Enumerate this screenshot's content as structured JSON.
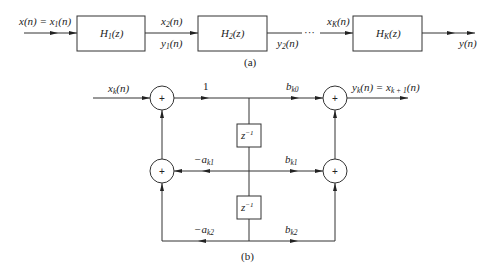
{
  "part_a": {
    "caption": "(a)",
    "input_label": "x(n) = x",
    "input_label_sub": "1",
    "input_label_tail": "(n)",
    "blocks": [
      {
        "name": "H",
        "sub": "1",
        "tail": "(z)"
      },
      {
        "name": "H",
        "sub": "2",
        "tail": "(z)"
      },
      {
        "name": "H",
        "sub": "K",
        "tail": "(z)"
      }
    ],
    "link1_top": {
      "base": "x",
      "sub": "2",
      "tail": "(n)"
    },
    "link1_bottom": {
      "base": "y",
      "sub": "1",
      "tail": "(n)"
    },
    "link2_bottom": {
      "base": "y",
      "sub": "2",
      "tail": "(n)"
    },
    "ellipsis": "···",
    "linkK_top": {
      "base": "x",
      "sub": "K",
      "tail": "(n)"
    },
    "output_label": "y(n)"
  },
  "part_b": {
    "caption": "(b)",
    "input_label": {
      "base": "x",
      "sub": "k",
      "tail": "(n)"
    },
    "unity_gain": "1",
    "delay_label": "z",
    "delay_exp": "−1",
    "adder_symbol": "+",
    "coef_b0": {
      "base": "b",
      "sub": "k0"
    },
    "coef_b1": {
      "base": "b",
      "sub": "k1"
    },
    "coef_b2": {
      "base": "b",
      "sub": "k2"
    },
    "coef_a1": {
      "base": "−a",
      "sub": "k1"
    },
    "coef_a2": {
      "base": "−a",
      "sub": "k2"
    },
    "output_label": {
      "base": "y",
      "sub": "k",
      "mid": "(n) = x",
      "sub2": "k + 1",
      "tail": "(n)"
    }
  }
}
